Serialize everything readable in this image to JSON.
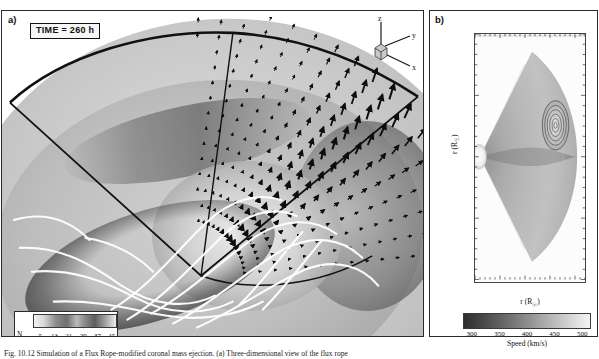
{
  "figure": {
    "caption": "Fig. 10.12   Simulation of a Flux Rope-modified coronal mass ejection. (a) Three-dimensional view of the flux rope",
    "panels": [
      "a)",
      "b)"
    ]
  },
  "panel_a": {
    "label": "a)",
    "time_annotation": "TIME = 260 h",
    "axis_triad": {
      "z": "z",
      "y": "y",
      "x": "x"
    },
    "colorbar": {
      "name": "N",
      "name_sub": "e",
      "ticks": [
        "5",
        "13",
        "21",
        "29",
        "37",
        "45"
      ],
      "low_color": "#f2f2f2",
      "high_color": "#5e5e5e"
    }
  },
  "panel_b": {
    "label": "b)",
    "xlabel_text": "r (R",
    "xlabel_sub": "☉",
    "xlabel_tail": ")",
    "ylabel_text": "r (R",
    "ylabel_sub": "☉",
    "ylabel_tail": ")",
    "yticks": [
      "200",
      "100",
      "0",
      "-100",
      "-200"
    ],
    "ytick_fracs": [
      0.075,
      0.29,
      0.5,
      0.71,
      0.925
    ],
    "xticks": [
      "0",
      "50",
      "100",
      "150",
      "200"
    ],
    "xtick_fracs": [
      0.04,
      0.27,
      0.5,
      0.73,
      0.96
    ],
    "colorbar": {
      "label": "Speed (km/s)",
      "ticks": [
        "300",
        "350",
        "400",
        "450",
        "500"
      ],
      "low_color": "#2f2f2f",
      "high_color": "#f4f4f4"
    }
  },
  "chart_data": {
    "type": "heatmap",
    "panels": [
      {
        "id": "a",
        "type": "volume-rendering",
        "quantity": "Electron density N_e",
        "time_hours": 260,
        "colorbar_ticks": [
          5,
          13,
          21,
          29,
          37,
          45
        ],
        "colorbar_range": [
          5,
          45
        ],
        "overlays": [
          "velocity-vector-field",
          "white-magnetic-field-lines",
          "cut-plane-outline"
        ],
        "axes": [
          "x",
          "y",
          "z"
        ]
      },
      {
        "id": "b",
        "type": "heatmap",
        "quantity": "Speed",
        "units": "km/s",
        "xlabel": "r (R☉)",
        "ylabel": "r (R☉)",
        "xlim": [
          0,
          215
        ],
        "ylim": [
          -215,
          215
        ],
        "xticks": [
          0,
          50,
          100,
          150,
          200
        ],
        "yticks": [
          -200,
          -100,
          0,
          100,
          200
        ],
        "colorbar_ticks": [
          300,
          350,
          400,
          450,
          500
        ],
        "colorbar_range": [
          280,
          520
        ],
        "grid": false,
        "contours_present": true,
        "contour_center": [
          178,
          28
        ],
        "contour_levels": [
          440,
          455,
          470,
          485,
          500
        ]
      }
    ]
  }
}
